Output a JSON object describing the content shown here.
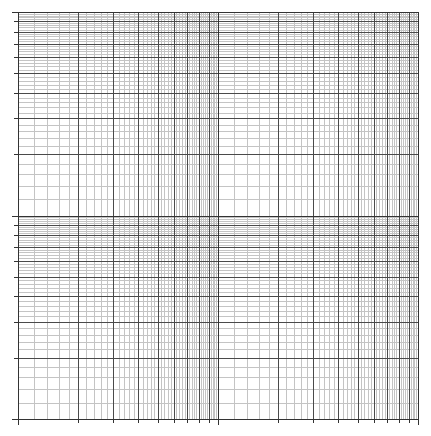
{
  "paper": {
    "kind": "log-log graph paper",
    "x_decades": 2,
    "y_decades": 2,
    "mantissas_major": [
      1,
      2,
      3,
      4,
      5,
      6,
      7,
      8,
      9,
      10
    ],
    "minor_step": 0.2,
    "colors": {
      "background": "#ffffff",
      "major_line": "#4a4a4a",
      "decade_line": "#333333",
      "minor_line": "#c4c4c4",
      "tick": "#333333"
    }
  },
  "layout": {
    "left": 18,
    "right": 418,
    "top": 12,
    "bottom": 419,
    "tick_length": 4
  }
}
